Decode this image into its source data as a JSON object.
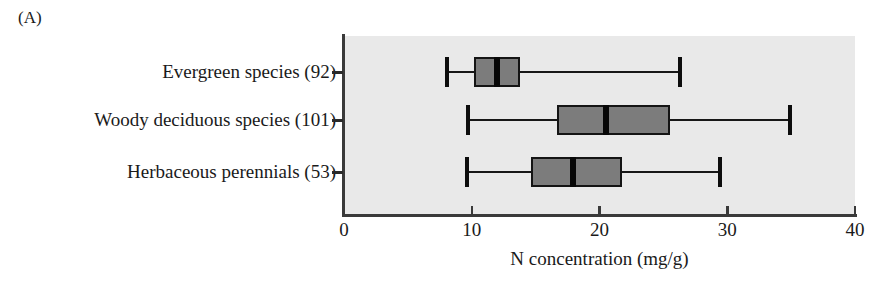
{
  "figure": {
    "panel_letter": "(A)"
  },
  "chart_data": {
    "type": "box",
    "title": "",
    "xlabel": "N concentration (mg/g)",
    "ylabel": "",
    "xlim": [
      0,
      40
    ],
    "xticks": [
      0,
      10,
      20,
      30,
      40
    ],
    "xticklabels": [
      "0",
      "10",
      "20",
      "30",
      "40"
    ],
    "grid": false,
    "legend": null,
    "orientation": "horizontal",
    "categories": [
      "Evergreen species  (92)",
      "Woody deciduous species (101)",
      "Herbaceous perennials (53)"
    ],
    "category_names": [
      "Evergreen species",
      "Woody deciduous species",
      "Herbaceous perennials"
    ],
    "sample_sizes": [
      92,
      101,
      53
    ],
    "boxes": [
      {
        "name": "Evergreen species",
        "n": 92,
        "min": 8.1,
        "q1": 10.2,
        "median": 12.0,
        "q3": 13.8,
        "max": 26.3
      },
      {
        "name": "Woody deciduous species",
        "n": 101,
        "min": 9.7,
        "q1": 16.7,
        "median": 20.5,
        "q3": 25.5,
        "max": 34.9
      },
      {
        "name": "Herbaceous perennials",
        "n": 53,
        "min": 9.6,
        "q1": 14.6,
        "median": 17.9,
        "q3": 21.8,
        "max": 29.4
      }
    ],
    "colors": {
      "plot_background": "#e9e9e9",
      "box_fill": "#7c7c7c",
      "box_edge": "#141414",
      "median": "#070707",
      "whisker": "#171717",
      "axis": "#3a3a3a",
      "text": "#1a1a1a"
    }
  }
}
